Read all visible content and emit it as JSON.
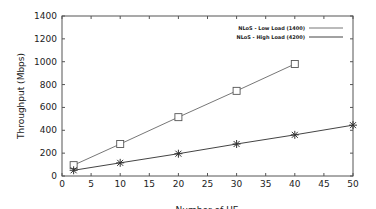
{
  "chart_data": {
    "type": "line",
    "title": "",
    "xlabel": "Number of UE",
    "ylabel": "Throughput (Mbps)",
    "xlim": [
      0,
      50
    ],
    "ylim": [
      0,
      1400
    ],
    "xticks": [
      0,
      5,
      10,
      15,
      20,
      25,
      30,
      35,
      40,
      45,
      50
    ],
    "yticks": [
      0,
      200,
      400,
      600,
      800,
      1000,
      1200,
      1400
    ],
    "grid": false,
    "legend_position": "upper right",
    "series": [
      {
        "name": "NLoS - Low Load (1400)",
        "marker": "square",
        "x": [
          2,
          10,
          20,
          30,
          40
        ],
        "values": [
          95,
          280,
          515,
          745,
          980
        ]
      },
      {
        "name": "NLoS - High Load (4200)",
        "marker": "star",
        "x": [
          2,
          10,
          20,
          30,
          40,
          50
        ],
        "values": [
          50,
          115,
          195,
          280,
          360,
          445
        ]
      }
    ]
  }
}
